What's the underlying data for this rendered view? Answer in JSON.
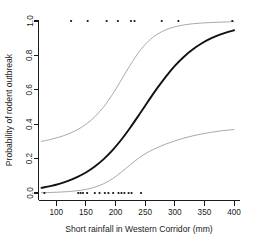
{
  "chart_data": {
    "type": "line",
    "title": "",
    "xlabel": "Short rainfall in Western Corridor (mm)",
    "ylabel": "Probability of rodent outbreak",
    "xlim": [
      70,
      410
    ],
    "ylim": [
      0.0,
      1.0
    ],
    "xticks": [
      100,
      150,
      200,
      250,
      300,
      350,
      400
    ],
    "xticklabels": [
      "100",
      "150",
      "200",
      "250",
      "300",
      "350",
      "400"
    ],
    "yticks": [
      0.0,
      0.2,
      0.4,
      0.6,
      0.8,
      1.0
    ],
    "yticklabels": [
      "0.0",
      "0.2",
      "0.4",
      "0.6",
      "0.8",
      "1.0"
    ],
    "grid": false,
    "legend": "none",
    "series": [
      {
        "name": "fitted logistic probability",
        "style": "solid-black",
        "x": [
          75,
          90,
          105,
          120,
          135,
          150,
          165,
          180,
          195,
          210,
          225,
          240,
          255,
          270,
          285,
          300,
          315,
          330,
          345,
          360,
          375,
          390,
          400
        ],
        "y": [
          0.03,
          0.04,
          0.053,
          0.07,
          0.092,
          0.119,
          0.154,
          0.197,
          0.249,
          0.311,
          0.381,
          0.456,
          0.533,
          0.608,
          0.677,
          0.739,
          0.791,
          0.834,
          0.869,
          0.897,
          0.919,
          0.937,
          0.946
        ]
      },
      {
        "name": "upper 95% confidence limit",
        "style": "thin-gray",
        "x": [
          75,
          90,
          105,
          120,
          135,
          150,
          165,
          180,
          195,
          210,
          225,
          240,
          255,
          270,
          285,
          300,
          315,
          330,
          345,
          360,
          375,
          390,
          400
        ],
        "y": [
          0.3,
          0.311,
          0.325,
          0.343,
          0.367,
          0.399,
          0.443,
          0.501,
          0.574,
          0.659,
          0.745,
          0.822,
          0.881,
          0.922,
          0.949,
          0.966,
          0.977,
          0.984,
          0.988,
          0.991,
          0.993,
          0.995,
          0.996
        ]
      },
      {
        "name": "lower 95% confidence limit",
        "style": "thin-gray",
        "x": [
          75,
          90,
          105,
          120,
          135,
          150,
          165,
          180,
          195,
          210,
          225,
          240,
          255,
          270,
          285,
          300,
          315,
          330,
          345,
          360,
          375,
          390,
          400
        ],
        "y": [
          0.002,
          0.003,
          0.005,
          0.008,
          0.013,
          0.021,
          0.034,
          0.054,
          0.083,
          0.122,
          0.165,
          0.205,
          0.238,
          0.263,
          0.285,
          0.303,
          0.319,
          0.332,
          0.343,
          0.352,
          0.36,
          0.366,
          0.369
        ]
      }
    ],
    "points": {
      "name": "observed outbreak occurrences",
      "marker": "dot",
      "outbreak_x": [
        125,
        153,
        185,
        204,
        226,
        232,
        278,
        306,
        397
      ],
      "outbreak_y": [
        1,
        1,
        1,
        1,
        1,
        1,
        1,
        1,
        1
      ],
      "no_outbreak_x": [
        80,
        137,
        141,
        145,
        152,
        165,
        173,
        182,
        188,
        196,
        205,
        210,
        215,
        222,
        227,
        243
      ],
      "no_outbreak_y": [
        0,
        0,
        0,
        0,
        0,
        0,
        0,
        0,
        0,
        0,
        0,
        0,
        0,
        0,
        0,
        0
      ]
    }
  },
  "figure": {
    "axis_color": "#1a1a1a",
    "fit_color": "#111111",
    "ci_color": "#9a9a9a",
    "point_color": "#111111",
    "background": "#ffffff"
  }
}
